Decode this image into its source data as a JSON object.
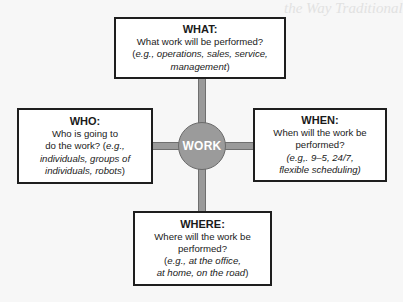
{
  "background": {
    "title_fragment": "the Way Traditional Work is Done",
    "note": "faint bleed-through text behind diagram"
  },
  "diagram": {
    "center": {
      "label": "WORK",
      "fill": "#9b9b9b",
      "text_color": "#ffffff"
    },
    "connector_color": "#9a9a9a",
    "boxes": {
      "what": {
        "heading": "WHAT:",
        "question": "What work will be performed?",
        "example_prefix": "(",
        "example_eg": "e.g., operations, sales, service,",
        "example_eg2": "management",
        "example_suffix": ")"
      },
      "who": {
        "heading": "WHO:",
        "question_line1": "Who is going to",
        "question_line2": "do the work? (",
        "example_eg": "e.g.,",
        "example_line2": "individuals, groups of",
        "example_line3": "individuals, robots",
        "example_suffix": ")"
      },
      "when": {
        "heading": "WHEN:",
        "question_line1": "When will the work be",
        "question_line2": "performed?",
        "example_line1": "(e.g,. 9–5, 24/7,",
        "example_line2": "flexible scheduling)"
      },
      "where": {
        "heading": "WHERE:",
        "question_line1": "Where will the work be",
        "question_line2": "performed?",
        "example_prefix": "(",
        "example_line1": "e.g., at the office,",
        "example_line2": "at home, on the road",
        "example_suffix": ")"
      }
    }
  }
}
